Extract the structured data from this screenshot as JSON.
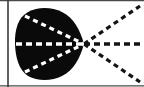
{
  "figure": {
    "type": "geometric-diagram",
    "width": 144,
    "height": 87,
    "background_color": "#ffffff"
  },
  "colors": {
    "ink": "#111111",
    "blob_fill": "#0a0a0a",
    "dash_light": "#ffffff",
    "dash_dark": "#141414",
    "border": "#3a3a3a",
    "background": "#ffffff"
  },
  "borders": {
    "left_rule": {
      "name": "left vertical rule",
      "x": 8,
      "y_start": 0,
      "y_end": 87,
      "thickness": 1.6,
      "color": "#3a3a3a"
    },
    "top_rule": {
      "name": "top horizontal rule",
      "y": 0.6,
      "x_start": 0,
      "x_end": 144,
      "thickness": 1.1,
      "color": "#4a4a4a"
    },
    "bottom_rule": {
      "name": "bottom horizontal rule",
      "y": 85.8,
      "x_start": 0,
      "x_end": 144,
      "thickness": 1.2,
      "color": "#4a4a4a"
    }
  },
  "blob": {
    "name": "filled cardioid region",
    "fill": "#0a0a0a",
    "cusp_point": {
      "x": 84,
      "y": 44
    },
    "leftmost_x": 15,
    "top_y": 8,
    "bottom_y": 80,
    "center": {
      "x": 48,
      "y": 44
    },
    "radius_x": 33,
    "radius_y": 36
  },
  "focus": {
    "name": "convergence point",
    "x": 84,
    "y": 44,
    "label": ""
  },
  "rays": [
    {
      "name": "upper ray",
      "id": "ray-upper",
      "angle_deg": -30,
      "inner_start": {
        "x": 25,
        "y": 16
      },
      "focus": {
        "x": 84,
        "y": 44
      },
      "outer_end": {
        "x": 140,
        "y": 6
      },
      "dash_pattern": "5 4",
      "stroke_width": 3.2
    },
    {
      "name": "middle horizontal ray",
      "id": "ray-middle",
      "angle_deg": 0,
      "inner_start": {
        "x": 16,
        "y": 44
      },
      "focus": {
        "x": 84,
        "y": 44
      },
      "outer_end": {
        "x": 144,
        "y": 44
      },
      "dash_pattern": "6 4",
      "stroke_width": 3.4
    },
    {
      "name": "lower ray",
      "id": "ray-lower",
      "angle_deg": 30,
      "inner_start": {
        "x": 25,
        "y": 72
      },
      "focus": {
        "x": 84,
        "y": 44
      },
      "outer_end": {
        "x": 140,
        "y": 82
      },
      "dash_pattern": "5 4",
      "stroke_width": 3.2
    }
  ]
}
